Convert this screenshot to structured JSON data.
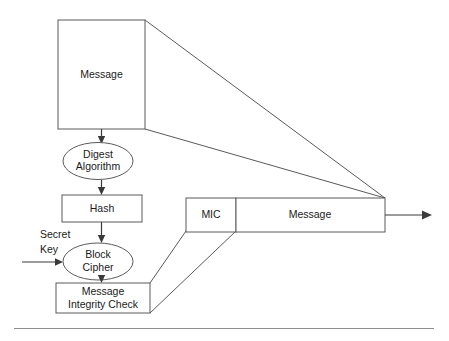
{
  "diagram": {
    "colors": {
      "background": "#ffffff",
      "shape_stroke": "#5a5a5a",
      "arrow_stroke": "#3a3a3a",
      "text": "#1a1a1a",
      "rule": "#8e8e8e"
    },
    "nodes": {
      "source_message": {
        "label": "Message",
        "shape": "rectangle"
      },
      "digest_algorithm": {
        "label_line1": "Digest",
        "label_line2": "Algorithm",
        "shape": "ellipse"
      },
      "hash": {
        "label": "Hash",
        "shape": "rectangle"
      },
      "secret_key": {
        "label_line1": "Secret",
        "label_line2": "Key",
        "shape": "text"
      },
      "block_cipher": {
        "label_line1": "Block",
        "label_line2": "Cipher",
        "shape": "ellipse"
      },
      "message_integrity_check": {
        "label_line1": "Message",
        "label_line2": "Integrity Check",
        "shape": "rectangle"
      },
      "mic_field": {
        "label": "MIC",
        "shape": "rectangle"
      },
      "output_message": {
        "label": "Message",
        "shape": "rectangle"
      }
    },
    "edges": [
      {
        "name": "message-to-digest",
        "from": "source_message",
        "to": "digest_algorithm",
        "arrow": true
      },
      {
        "name": "digest-to-hash",
        "from": "digest_algorithm",
        "to": "hash",
        "arrow": true
      },
      {
        "name": "hash-to-block-cipher",
        "from": "hash",
        "to": "block_cipher",
        "arrow": true
      },
      {
        "name": "secret-key-to-block-cipher",
        "from": "secret_key",
        "to": "block_cipher",
        "arrow": true
      },
      {
        "name": "block-cipher-to-mic",
        "from": "block_cipher",
        "to": "message_integrity_check",
        "arrow": true
      },
      {
        "name": "message-copy-upper",
        "from": "source_message",
        "to": "output_message",
        "arrow": false
      },
      {
        "name": "message-copy-lower",
        "from": "source_message",
        "to": "output_message",
        "arrow": false
      },
      {
        "name": "mic-map-upper",
        "from": "mic_field",
        "to": "message_integrity_check",
        "arrow": false
      },
      {
        "name": "mic-map-lower",
        "from": "mic_field",
        "to": "message_integrity_check",
        "arrow": false
      },
      {
        "name": "output-transmit",
        "from": "output_message",
        "to": "transmission",
        "arrow": true
      }
    ]
  }
}
